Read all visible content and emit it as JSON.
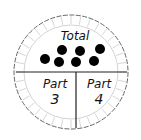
{
  "diagram": {
    "type": "part-part-whole",
    "total": {
      "label": "Total",
      "dot_count": 7
    },
    "parts": [
      {
        "label": "Part",
        "value": "3"
      },
      {
        "label": "Part",
        "value": "4"
      }
    ],
    "colors": {
      "line": "#222222",
      "dots": "#000000",
      "scallop": "#b8b8b8",
      "background": "#ffffff"
    }
  }
}
